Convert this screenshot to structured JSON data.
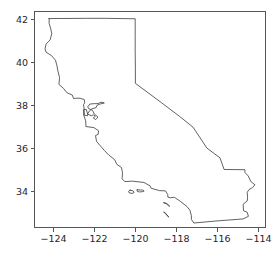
{
  "chart_data": {
    "type": "line",
    "title": "",
    "subtitle": "",
    "xlabel": "",
    "ylabel": "",
    "legend": [],
    "grid": false,
    "legend_position": "none",
    "xlim": [
      -124.95,
      -113.6
    ],
    "ylim": [
      32.3,
      42.35
    ],
    "xticks": [
      -124,
      -122,
      -120,
      -118,
      -116,
      -114
    ],
    "xticklabels": [
      "−124",
      "−122",
      "−120",
      "−118",
      "−116",
      "−114"
    ],
    "yticks": [
      34,
      36,
      38,
      40,
      42
    ],
    "yticklabels": [
      "34",
      "36",
      "38",
      "40",
      "42"
    ],
    "line_color": "#3a3a3a",
    "axis_color": "#555555",
    "background_color": "#ffffff",
    "series": [
      {
        "name": "california-boundary",
        "closed": true,
        "points": [
          [
            -124.21,
            42.0
          ],
          [
            -122.38,
            42.01
          ],
          [
            -121.45,
            42.01
          ],
          [
            -120.0,
            41.99
          ],
          [
            -120.0,
            41.18
          ],
          [
            -120.0,
            40.5
          ],
          [
            -119.99,
            39.72
          ],
          [
            -119.99,
            39.0
          ],
          [
            -118.71,
            38.1
          ],
          [
            -117.83,
            37.47
          ],
          [
            -117.17,
            36.97
          ],
          [
            -116.49,
            36.0
          ],
          [
            -115.85,
            35.55
          ],
          [
            -115.65,
            35.01
          ],
          [
            -114.63,
            35.0
          ],
          [
            -114.63,
            34.87
          ],
          [
            -114.47,
            34.71
          ],
          [
            -114.34,
            34.45
          ],
          [
            -114.14,
            34.3
          ],
          [
            -114.26,
            34.17
          ],
          [
            -114.43,
            34.08
          ],
          [
            -114.52,
            33.95
          ],
          [
            -114.5,
            33.7
          ],
          [
            -114.52,
            33.55
          ],
          [
            -114.72,
            33.4
          ],
          [
            -114.7,
            33.1
          ],
          [
            -114.52,
            33.03
          ],
          [
            -114.46,
            32.84
          ],
          [
            -114.72,
            32.72
          ],
          [
            -115.0,
            32.7
          ],
          [
            -116.1,
            32.62
          ],
          [
            -117.13,
            32.53
          ],
          [
            -117.25,
            32.7
          ],
          [
            -117.25,
            32.87
          ],
          [
            -117.32,
            33.12
          ],
          [
            -117.47,
            33.3
          ],
          [
            -117.8,
            33.54
          ],
          [
            -118.08,
            33.72
          ],
          [
            -118.27,
            33.7
          ],
          [
            -118.4,
            33.73
          ],
          [
            -118.41,
            33.86
          ],
          [
            -118.52,
            34.02
          ],
          [
            -118.8,
            34.03
          ],
          [
            -119.22,
            34.14
          ],
          [
            -119.27,
            34.25
          ],
          [
            -119.57,
            34.41
          ],
          [
            -120.14,
            34.47
          ],
          [
            -120.51,
            34.45
          ],
          [
            -120.64,
            34.58
          ],
          [
            -120.62,
            34.86
          ],
          [
            -120.67,
            35.1
          ],
          [
            -120.9,
            35.25
          ],
          [
            -121.0,
            35.46
          ],
          [
            -121.28,
            35.67
          ],
          [
            -121.5,
            35.88
          ],
          [
            -121.89,
            36.31
          ],
          [
            -121.94,
            36.58
          ],
          [
            -121.81,
            36.64
          ],
          [
            -121.79,
            36.8
          ],
          [
            -122.02,
            36.95
          ],
          [
            -122.41,
            37.0
          ],
          [
            -122.42,
            37.26
          ],
          [
            -122.52,
            37.53
          ],
          [
            -122.52,
            37.78
          ],
          [
            -122.39,
            37.79
          ],
          [
            -122.33,
            37.58
          ],
          [
            -122.15,
            37.5
          ],
          [
            -122.03,
            37.54
          ],
          [
            -121.95,
            37.47
          ],
          [
            -122.05,
            37.4
          ],
          [
            -121.93,
            37.32
          ],
          [
            -121.82,
            37.44
          ],
          [
            -122.0,
            37.58
          ],
          [
            -122.09,
            37.75
          ],
          [
            -122.28,
            37.83
          ],
          [
            -122.32,
            37.91
          ],
          [
            -122.22,
            38.04
          ],
          [
            -121.99,
            38.06
          ],
          [
            -121.82,
            38.06
          ],
          [
            -121.67,
            38.13
          ],
          [
            -121.51,
            38.09
          ],
          [
            -121.72,
            38.04
          ],
          [
            -121.86,
            37.99
          ],
          [
            -121.92,
            37.87
          ],
          [
            -122.11,
            37.82
          ],
          [
            -122.24,
            37.72
          ],
          [
            -122.32,
            37.6
          ],
          [
            -122.33,
            37.5
          ],
          [
            -122.48,
            37.52
          ],
          [
            -122.5,
            37.7
          ],
          [
            -122.5,
            37.86
          ],
          [
            -122.53,
            38.01
          ],
          [
            -122.47,
            38.1
          ],
          [
            -122.49,
            38.25
          ],
          [
            -122.7,
            38.31
          ],
          [
            -122.93,
            38.31
          ],
          [
            -123.01,
            38.29
          ],
          [
            -123.08,
            38.46
          ],
          [
            -123.33,
            38.56
          ],
          [
            -123.51,
            38.77
          ],
          [
            -123.73,
            38.95
          ],
          [
            -123.7,
            39.27
          ],
          [
            -123.78,
            39.57
          ],
          [
            -123.83,
            39.83
          ],
          [
            -123.9,
            40.07
          ],
          [
            -124.1,
            40.29
          ],
          [
            -124.36,
            40.44
          ],
          [
            -124.41,
            40.6
          ],
          [
            -124.36,
            40.82
          ],
          [
            -124.16,
            41.01
          ],
          [
            -124.08,
            41.3
          ],
          [
            -124.14,
            41.56
          ],
          [
            -124.21,
            41.78
          ],
          [
            -124.21,
            42.0
          ]
        ]
      }
    ],
    "islands": [
      {
        "name": "santa-cruz-island",
        "points": [
          [
            -119.9,
            34.07
          ],
          [
            -119.75,
            34.06
          ],
          [
            -119.63,
            34.06
          ],
          [
            -119.56,
            34.01
          ],
          [
            -119.66,
            33.98
          ],
          [
            -119.8,
            33.97
          ],
          [
            -119.9,
            34.0
          ],
          [
            -119.9,
            34.07
          ]
        ]
      },
      {
        "name": "santa-rosa-island",
        "points": [
          [
            -120.25,
            34.05
          ],
          [
            -120.1,
            34.02
          ],
          [
            -120.05,
            33.95
          ],
          [
            -120.15,
            33.9
          ],
          [
            -120.3,
            33.93
          ],
          [
            -120.32,
            34.0
          ],
          [
            -120.25,
            34.05
          ]
        ]
      },
      {
        "name": "santa-catalina-island",
        "points": [
          [
            -118.6,
            33.47
          ],
          [
            -118.47,
            33.42
          ],
          [
            -118.37,
            33.33
          ],
          [
            -118.31,
            33.31
          ],
          [
            -118.4,
            33.39
          ],
          [
            -118.5,
            33.45
          ],
          [
            -118.6,
            33.47
          ]
        ]
      },
      {
        "name": "san-clemente-island",
        "points": [
          [
            -118.59,
            33.03
          ],
          [
            -118.48,
            32.93
          ],
          [
            -118.38,
            32.82
          ],
          [
            -118.35,
            32.8
          ],
          [
            -118.44,
            32.9
          ],
          [
            -118.55,
            33.02
          ],
          [
            -118.59,
            33.03
          ]
        ]
      }
    ]
  }
}
